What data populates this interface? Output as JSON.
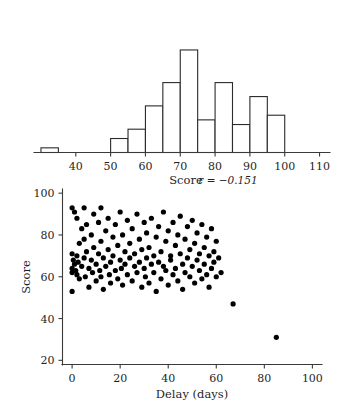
{
  "figure": {
    "background_color": "#ffffff",
    "ink_color": "#1f1f1f",
    "point_color": "#000000"
  },
  "chart_data": [
    {
      "type": "bar",
      "name": "score-histogram",
      "title": "",
      "xlabel": "Score",
      "ylabel": "",
      "xlim": [
        28,
        113
      ],
      "ylim": [
        0,
        28
      ],
      "grid": false,
      "bin_width": 5,
      "bin_edges": [
        30,
        35,
        50,
        55,
        60,
        65,
        70,
        75,
        80,
        85,
        90,
        95,
        100
      ],
      "categories": [
        "30-35",
        "50-55",
        "55-60",
        "60-65",
        "65-70",
        "70-75",
        "75-80",
        "80-85",
        "85-90",
        "90-95",
        "95-100"
      ],
      "bins": [
        {
          "start": 30,
          "end": 35,
          "count": 1
        },
        {
          "start": 50,
          "end": 55,
          "count": 3
        },
        {
          "start": 55,
          "end": 60,
          "count": 5
        },
        {
          "start": 60,
          "end": 65,
          "count": 10
        },
        {
          "start": 65,
          "end": 70,
          "count": 15
        },
        {
          "start": 70,
          "end": 75,
          "count": 22
        },
        {
          "start": 75,
          "end": 80,
          "count": 7
        },
        {
          "start": 80,
          "end": 85,
          "count": 15
        },
        {
          "start": 85,
          "end": 90,
          "count": 6
        },
        {
          "start": 90,
          "end": 95,
          "count": 12
        },
        {
          "start": 95,
          "end": 100,
          "count": 8
        }
      ],
      "values": [
        1,
        3,
        5,
        10,
        15,
        22,
        7,
        15,
        6,
        12,
        8
      ],
      "xticks": [
        40,
        50,
        60,
        70,
        80,
        90,
        100,
        110
      ],
      "xticklabels": [
        "40",
        "50",
        "60",
        "70",
        "80",
        "90",
        "100",
        "110"
      ]
    },
    {
      "type": "scatter",
      "name": "delay-score-scatter",
      "title": "",
      "xlabel": "Delay (days)",
      "ylabel": "Score",
      "xlim": [
        -4,
        104
      ],
      "ylim": [
        18,
        102
      ],
      "grid": false,
      "xticks": [
        0,
        20,
        40,
        60,
        80,
        100
      ],
      "xticklabels": [
        "0",
        "20",
        "40",
        "60",
        "80",
        "100"
      ],
      "yticks": [
        20,
        40,
        60,
        80,
        100
      ],
      "yticklabels": [
        "20",
        "40",
        "60",
        "80",
        "100"
      ],
      "annotation": {
        "text": "r = −0.151",
        "statistic": "r",
        "value": -0.151
      },
      "marker_size": 2.6,
      "points": [
        [
          0,
          93
        ],
        [
          0,
          71
        ],
        [
          0,
          64
        ],
        [
          0,
          62
        ],
        [
          0,
          53
        ],
        [
          0.5,
          68
        ],
        [
          1,
          91
        ],
        [
          1,
          66
        ],
        [
          1.5,
          63
        ],
        [
          2,
          88
        ],
        [
          2,
          70
        ],
        [
          2,
          61
        ],
        [
          2.5,
          67
        ],
        [
          3,
          76
        ],
        [
          3,
          59
        ],
        [
          4,
          83
        ],
        [
          4,
          65
        ],
        [
          5,
          93
        ],
        [
          5,
          78
        ],
        [
          5,
          69
        ],
        [
          5.5,
          60
        ],
        [
          6,
          85
        ],
        [
          6,
          72
        ],
        [
          7,
          64
        ],
        [
          7,
          55
        ],
        [
          8,
          80
        ],
        [
          8,
          68
        ],
        [
          8.5,
          62
        ],
        [
          9,
          90
        ],
        [
          9,
          74
        ],
        [
          10,
          66
        ],
        [
          10,
          58
        ],
        [
          11,
          86
        ],
        [
          11,
          71
        ],
        [
          11.5,
          63
        ],
        [
          12,
          93
        ],
        [
          12,
          77
        ],
        [
          12,
          60
        ],
        [
          13,
          69
        ],
        [
          13,
          54
        ],
        [
          14,
          82
        ],
        [
          14,
          65
        ],
        [
          15,
          88
        ],
        [
          15,
          73
        ],
        [
          15.5,
          61
        ],
        [
          16,
          67
        ],
        [
          16,
          57
        ],
        [
          17,
          79
        ],
        [
          17,
          70
        ],
        [
          18,
          85
        ],
        [
          18,
          63
        ],
        [
          19,
          75
        ],
        [
          19,
          59
        ],
        [
          20,
          91
        ],
        [
          20,
          68
        ],
        [
          20.5,
          64
        ],
        [
          21,
          80
        ],
        [
          21,
          56
        ],
        [
          22,
          72
        ],
        [
          22,
          66
        ],
        [
          23,
          87
        ],
        [
          23,
          61
        ],
        [
          24,
          76
        ],
        [
          24,
          69
        ],
        [
          25,
          83
        ],
        [
          25,
          58
        ],
        [
          26,
          71
        ],
        [
          26,
          65
        ],
        [
          27,
          90
        ],
        [
          27,
          62
        ],
        [
          28,
          78
        ],
        [
          28,
          67
        ],
        [
          29,
          73
        ],
        [
          29,
          55
        ],
        [
          30,
          86
        ],
        [
          30,
          64
        ],
        [
          30.5,
          60
        ],
        [
          31,
          81
        ],
        [
          31,
          69
        ],
        [
          32,
          74
        ],
        [
          32,
          57
        ],
        [
          33,
          88
        ],
        [
          33,
          66
        ],
        [
          34,
          70
        ],
        [
          34,
          62
        ],
        [
          35,
          79
        ],
        [
          35,
          53
        ],
        [
          36,
          84
        ],
        [
          36,
          67
        ],
        [
          37,
          72
        ],
        [
          37,
          59
        ],
        [
          38,
          91
        ],
        [
          38,
          65
        ],
        [
          39,
          77
        ],
        [
          39,
          63
        ],
        [
          40,
          82
        ],
        [
          40,
          56
        ],
        [
          41,
          70
        ],
        [
          41,
          68
        ],
        [
          42,
          86
        ],
        [
          42,
          61
        ],
        [
          43,
          75
        ],
        [
          43,
          64
        ],
        [
          44,
          80
        ],
        [
          44,
          58
        ],
        [
          45,
          89
        ],
        [
          45,
          71
        ],
        [
          46,
          66
        ],
        [
          46,
          54
        ],
        [
          47,
          78
        ],
        [
          47,
          62
        ],
        [
          48,
          84
        ],
        [
          48,
          69
        ],
        [
          49,
          73
        ],
        [
          49,
          60
        ],
        [
          50,
          87
        ],
        [
          50,
          65
        ],
        [
          51,
          76
        ],
        [
          51,
          57
        ],
        [
          52,
          81
        ],
        [
          52,
          68
        ],
        [
          53,
          71
        ],
        [
          53,
          63
        ],
        [
          54,
          85
        ],
        [
          54,
          59
        ],
        [
          55,
          74
        ],
        [
          55,
          66
        ],
        [
          56,
          79
        ],
        [
          56,
          61
        ],
        [
          57,
          70
        ],
        [
          57,
          55
        ],
        [
          58,
          83
        ],
        [
          58,
          64
        ],
        [
          59,
          72
        ],
        [
          59,
          67
        ],
        [
          60,
          77
        ],
        [
          60,
          60
        ],
        [
          61,
          69
        ],
        [
          62,
          62
        ],
        [
          67,
          47
        ],
        [
          85,
          31
        ]
      ]
    }
  ]
}
